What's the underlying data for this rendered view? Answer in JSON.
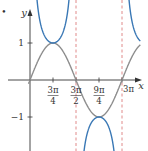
{
  "chart_data": {
    "type": "line",
    "title": "",
    "xlabel": "x",
    "ylabel": "y",
    "marker": "•",
    "xlim": [
      0,
      3.3
    ],
    "ylim": [
      -1.9,
      1.9
    ],
    "grid": false,
    "legend": null,
    "x_ticks": [
      {
        "value_over_pi": 0.75,
        "num": "3π",
        "den": "4"
      },
      {
        "value_over_pi": 1.5,
        "num": "3π",
        "den": "2"
      },
      {
        "value_over_pi": 2.25,
        "num": "9π",
        "den": "4"
      },
      {
        "value_over_pi": 3.0,
        "label": "3π"
      }
    ],
    "y_ticks": [
      {
        "value": 1,
        "label": "1"
      },
      {
        "value": -1,
        "label": "−1"
      }
    ],
    "asymptotes_over_pi": [
      1.5,
      3.0
    ],
    "series": [
      {
        "name": "y = sin(2x/3)",
        "color": "#8c8c8c",
        "style": "solid",
        "formula": "sin(2x/3)",
        "key_points": [
          {
            "x_over_pi": 0,
            "y": 0
          },
          {
            "x_over_pi": 0.75,
            "y": 1
          },
          {
            "x_over_pi": 1.5,
            "y": 0
          },
          {
            "x_over_pi": 2.25,
            "y": -1
          },
          {
            "x_over_pi": 3.0,
            "y": 0
          }
        ]
      },
      {
        "name": "y = csc(2x/3)",
        "color": "#3a78b5",
        "style": "solid",
        "formula": "csc(2x/3)",
        "key_points": [
          {
            "x_over_pi": 0.75,
            "y": 1
          },
          {
            "x_over_pi": 2.25,
            "y": -1
          }
        ]
      }
    ],
    "asymptote_color": "#e08a8a"
  }
}
